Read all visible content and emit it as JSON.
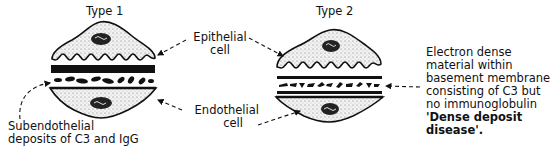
{
  "diagram": {
    "panels": [
      {
        "id": "type1",
        "title": "Type 1"
      },
      {
        "id": "type2",
        "title": "Type 2"
      }
    ],
    "labels": {
      "epithelial": [
        "Epithelial",
        "cell"
      ],
      "endothelial": [
        "Endothelial",
        "cell"
      ],
      "type1_note": [
        "Subendothelial",
        "deposits of C3 and IgG"
      ],
      "type2_note": [
        "Electron dense",
        "material within",
        "basement membrane",
        "consisting of C3 but",
        "no immunoglobulin"
      ],
      "type2_name": [
        "'Dense deposit",
        "disease'."
      ]
    },
    "colors": {
      "ink": "#111111",
      "stipple": "#e6e6e6",
      "background": "#ffffff"
    }
  }
}
